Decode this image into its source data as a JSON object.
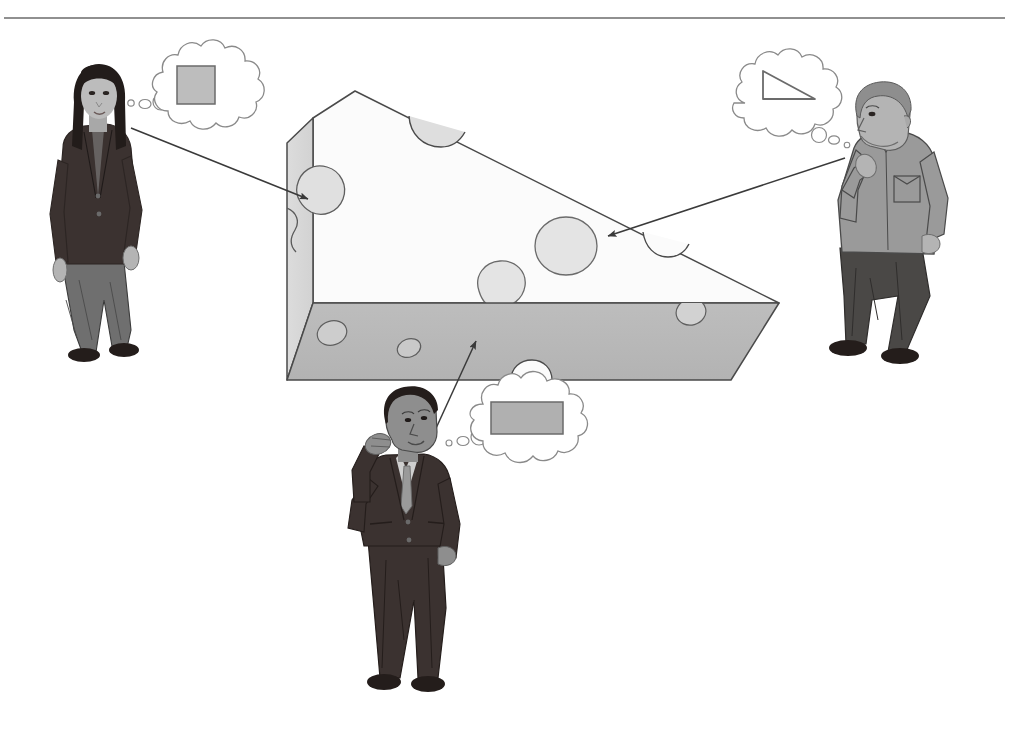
{
  "figure": {
    "title": "Three observers viewing a wedge of cheese from different directions",
    "background_color": "#ffffff",
    "top_rule": {
      "name": "top-border-rule",
      "color": "#6b6b6b",
      "y": 18,
      "x_start": 4,
      "x_end": 1005,
      "thickness": 1.6
    }
  },
  "palette": {
    "outline": "#4a4a4a",
    "outline_dark": "#3a3a3a",
    "cheese_front_face": "#fbfbfb",
    "cheese_side_face": "#d8d8d8",
    "cheese_bottom_face": "#b9b9b9",
    "cheese_hole_fill": "#e2e2e2",
    "cheese_hole_deep": "#cfcfcf",
    "thought_bubble_fill": "#ffffff",
    "thought_bubble_stroke": "#8a8a8a",
    "shape_square_fill": "#bdbdbd",
    "shape_rect_fill": "#b0b0b0",
    "shape_triangle_fill": "none",
    "arrow_color": "#3a3a3a",
    "suit_dark": "#3b3230",
    "suit_dark_shadow": "#2c2523",
    "trousers_gray": "#6f6f6f",
    "trousers_dark": "#4a4846",
    "shirt_gray": "#9a9a9a",
    "skin_gray": "#b4b4b4",
    "skin_shadow": "#8e8e8e",
    "hair_dark": "#221c1a",
    "hair_gray": "#8e8e8e",
    "shoe_dark": "#241d1b"
  },
  "cheese": {
    "name": "cheese-wedge",
    "description": "Three-dimensional triangular wedge of Swiss cheese with holes",
    "faces": [
      {
        "name": "left-square-face",
        "label": "square cross-section face",
        "fill": "#d8d8d8"
      },
      {
        "name": "front-triangular-face",
        "label": "triangular front face",
        "fill": "#fbfbfb"
      },
      {
        "name": "bottom-rectangular-face",
        "label": "rectangular bottom face",
        "fill": "#b9b9b9"
      }
    ],
    "apex": {
      "x": 355,
      "y": 91
    },
    "tip": {
      "x": 779,
      "y": 303
    },
    "holes_count": 9
  },
  "observers": [
    {
      "id": "observer-left",
      "name": "woman-observer",
      "position": "left",
      "pose": "standing, arms at side",
      "clothing": {
        "top": "dark blazer",
        "bottom": "gray trousers",
        "hair": "long dark hair"
      },
      "perceives": "square",
      "thought_shape": {
        "name": "square-shape",
        "type": "square",
        "fill": "#bdbdbd",
        "stroke": "#6b6b6b"
      }
    },
    {
      "id": "observer-right",
      "name": "man-observer-thinking",
      "position": "right",
      "pose": "leaning, hand on chin",
      "clothing": {
        "top": "gray work shirt with chest pocket",
        "bottom": "dark trousers",
        "hair": "short gray hair"
      },
      "perceives": "triangle",
      "thought_shape": {
        "name": "triangle-shape",
        "type": "right-triangle",
        "fill": "none",
        "stroke": "#6b6b6b"
      }
    },
    {
      "id": "observer-bottom",
      "name": "man-observer-suit",
      "position": "bottom-center",
      "pose": "standing, scratching head, looking up",
      "clothing": {
        "top": "dark suit jacket with tie",
        "bottom": "dark suit trousers",
        "hair": "short dark hair"
      },
      "perceives": "rectangle",
      "thought_shape": {
        "name": "rectangle-shape",
        "type": "rectangle",
        "fill": "#b0b0b0",
        "stroke": "#6b6b6b"
      }
    }
  ],
  "sight_lines": [
    {
      "name": "sight-line-left",
      "from_observer": "observer-left",
      "start": {
        "x": 131,
        "y": 128
      },
      "end": {
        "x": 308,
        "y": 199
      },
      "arrowhead": "end"
    },
    {
      "name": "sight-line-right",
      "from_observer": "observer-right",
      "start": {
        "x": 845,
        "y": 158
      },
      "end": {
        "x": 608,
        "y": 236
      },
      "arrowhead": "end"
    },
    {
      "name": "sight-line-bottom",
      "from_observer": "observer-bottom",
      "start": {
        "x": 432,
        "y": 437
      },
      "end": {
        "x": 476,
        "y": 341
      },
      "arrowhead": "end"
    }
  ]
}
